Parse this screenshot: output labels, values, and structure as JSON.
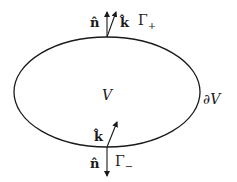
{
  "diagram": {
    "region_label": "V",
    "boundary_label": "∂V",
    "top": {
      "normal_label": "n̂",
      "k_label": "k̂",
      "gamma_label": "Γ",
      "gamma_sub": "+"
    },
    "bottom": {
      "normal_label": "n̂",
      "k_label": "k̂",
      "gamma_label": "Γ",
      "gamma_sub": "−"
    },
    "colors": {
      "stroke": "#1a1a1a",
      "background": "#ffffff"
    }
  }
}
